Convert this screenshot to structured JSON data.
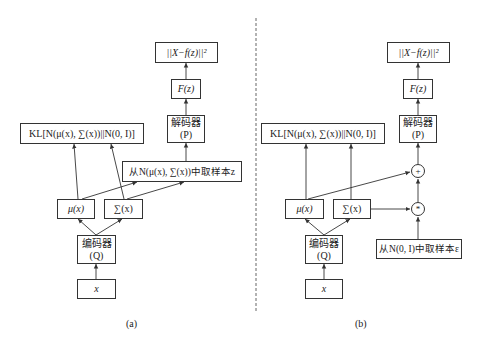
{
  "panel_a": {
    "loss": "||X−f(z)||²",
    "f_z": "F(z)",
    "decoder": {
      "line1": "解码器",
      "line2": "(P)"
    },
    "kl": "KL[N(μ(x), ∑(x))||N(0, I)]",
    "sample": "从N(μ(x), ∑(x))中取样本z",
    "mu": "μ(x)",
    "sigma": "∑(x)",
    "encoder": {
      "line1": "编码器",
      "line2": "(Q)"
    },
    "input": "x",
    "caption": "(a)"
  },
  "panel_b": {
    "loss": "||X−f(z)||²",
    "f_z": "F(z)",
    "decoder": {
      "line1": "解码器",
      "line2": "(P)"
    },
    "kl": "KL[N(μ(x), ∑(x))||N(0, I)]",
    "plus": "+",
    "mult": "*",
    "mu": "μ(x)",
    "sigma": "∑(x)",
    "encoder": {
      "line1": "编码器",
      "line2": "(Q)"
    },
    "input": "x",
    "noise": "从N(0, I)中取样本ε",
    "caption": "(b)"
  }
}
